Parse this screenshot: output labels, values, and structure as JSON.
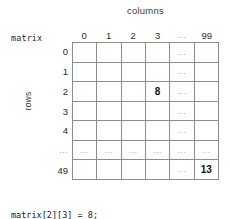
{
  "diagram": {
    "columns_title": "columns",
    "rows_title": "rows",
    "matrix_label": "matrix",
    "ellipsis": "...",
    "column_headers": [
      "0",
      "1",
      "2",
      "3",
      "...",
      "99"
    ],
    "row_headers": [
      "0",
      "1",
      "2",
      "3",
      "4",
      "...",
      "49"
    ],
    "grid": {
      "rows": 7,
      "cols": 6,
      "cells": [
        [
          "",
          "",
          "",
          "",
          "...",
          ""
        ],
        [
          "",
          "",
          "",
          "",
          "...",
          ""
        ],
        [
          "",
          "",
          "",
          "8",
          "...",
          ""
        ],
        [
          "",
          "",
          "",
          "",
          "...",
          ""
        ],
        [
          "",
          "",
          "",
          "",
          "...",
          ""
        ],
        [
          "...",
          "...",
          "...",
          "...",
          "...",
          "..."
        ],
        [
          "",
          "",
          "",
          "",
          "...",
          "13"
        ]
      ],
      "highlighted": [
        {
          "row": 2,
          "col": 3,
          "value": "8"
        },
        {
          "row": 6,
          "col": 5,
          "value": "13"
        }
      ],
      "line_color": "#8d8d8d"
    },
    "code_lines": [
      "matrix[2][3] = 8;",
      "matrix[49][99] = 13;"
    ]
  }
}
